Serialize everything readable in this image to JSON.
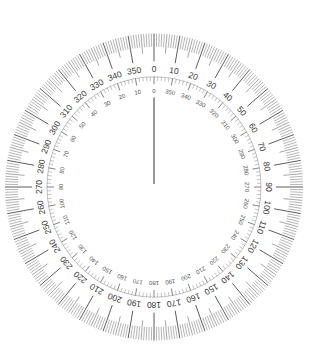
{
  "figure": {
    "type": "compass-rose",
    "outer_scale": {
      "direction": "clockwise",
      "zero_position": "top",
      "range": [
        0,
        360
      ],
      "minor_tick_step_deg": 1,
      "mid_tick_step_deg": 5,
      "major_tick_step_deg": 10,
      "labels": [
        "0",
        "10",
        "20",
        "30",
        "40",
        "50",
        "60",
        "70",
        "80",
        "90",
        "100",
        "110",
        "120",
        "130",
        "140",
        "150",
        "160",
        "170",
        "180",
        "190",
        "200",
        "210",
        "220",
        "230",
        "240",
        "250",
        "260",
        "270",
        "280",
        "290",
        "300",
        "310",
        "320",
        "330",
        "340",
        "350"
      ]
    },
    "inner_scale": {
      "direction": "counterclockwise",
      "zero_position": "top",
      "range": [
        0,
        360
      ],
      "minor_tick_step_deg": 2,
      "major_tick_step_deg": 10,
      "labels": [
        "0",
        "10",
        "20",
        "30",
        "40",
        "50",
        "60",
        "70",
        "80",
        "90",
        "100",
        "110",
        "120",
        "130",
        "140",
        "150",
        "160",
        "170",
        "180",
        "190",
        "200",
        "210",
        "220",
        "230",
        "240",
        "250",
        "260",
        "270",
        "280",
        "290",
        "300",
        "310",
        "320",
        "330",
        "340",
        "350"
      ]
    },
    "needle": {
      "bearing_deg": 0
    },
    "colors": {
      "tick": "#6a6a6a",
      "major_tick": "#333333",
      "label": "#3a3a3a",
      "background": "#ffffff"
    }
  }
}
